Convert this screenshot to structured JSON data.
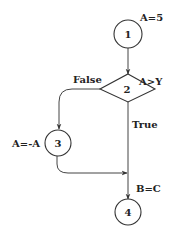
{
  "diagram": {
    "type": "control-flow-graph",
    "colors": {
      "stroke": "#333333",
      "text": "#222222",
      "background": "#ffffff"
    },
    "nodes": [
      {
        "id": "1",
        "shape": "circle",
        "label": "1",
        "annotation": "A=5"
      },
      {
        "id": "2",
        "shape": "diamond",
        "label": "2",
        "annotation": "A>Y"
      },
      {
        "id": "3",
        "shape": "circle",
        "label": "3",
        "annotation": "A=-A"
      },
      {
        "id": "4",
        "shape": "circle",
        "label": "4",
        "annotation": "B=C"
      }
    ],
    "edges": [
      {
        "from": "1",
        "to": "2",
        "label": ""
      },
      {
        "from": "2",
        "to": "3",
        "label": "False"
      },
      {
        "from": "2",
        "to": "4",
        "label": "True"
      },
      {
        "from": "3",
        "to": "4",
        "label": ""
      }
    ]
  }
}
